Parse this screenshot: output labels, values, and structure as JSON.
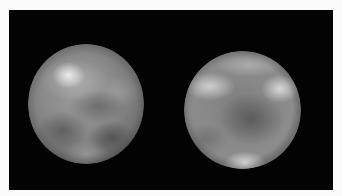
{
  "image": {
    "description": "Two grayscale images of a mottled spherical body (Pluto-like) against a black background",
    "background_color": "#030303",
    "border_color": "#fbfbfb",
    "bodies": [
      {
        "name": "left-hemisphere",
        "tone": "gray",
        "features": [
          "bright spot upper-left",
          "dark patches lower half"
        ]
      },
      {
        "name": "right-hemisphere",
        "tone": "gray",
        "features": [
          "bright patches upper-left and upper-right",
          "dark center",
          "bright spot at bottom"
        ]
      }
    ]
  }
}
